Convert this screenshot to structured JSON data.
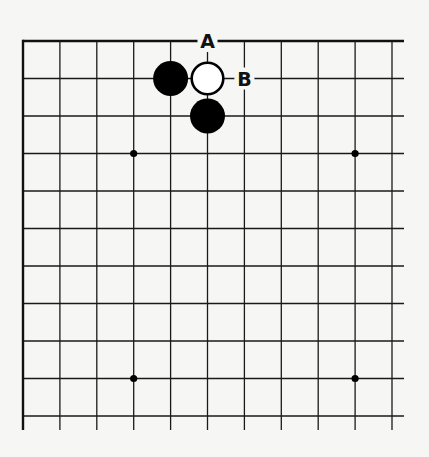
{
  "diagram": {
    "type": "go-board-corner",
    "grid": {
      "columns": 11,
      "rows": 11,
      "origin_x": 23,
      "origin_y": 41,
      "spacing_x": 36.9,
      "spacing_y": 37.5,
      "extend_right": 12,
      "extend_bottom": 14,
      "line_color": "#1a1a1a",
      "edge_line_color": "#111111",
      "edges": [
        "top",
        "left"
      ]
    },
    "star_points": [
      {
        "col": 3,
        "row": 3
      },
      {
        "col": 9,
        "row": 3
      },
      {
        "col": 3,
        "row": 9
      },
      {
        "col": 9,
        "row": 9
      }
    ],
    "stones": [
      {
        "color": "black",
        "col": 4,
        "row": 1
      },
      {
        "color": "white",
        "col": 5,
        "row": 1
      },
      {
        "color": "black",
        "col": 5,
        "row": 2
      }
    ],
    "labels": [
      {
        "text": "A",
        "col": 5,
        "row": 0
      },
      {
        "text": "B",
        "col": 6,
        "row": 1
      }
    ],
    "colors": {
      "background": "#f6f6f4",
      "black_stone": "#000000",
      "white_stone_fill": "#ffffff",
      "white_stone_stroke": "#000000"
    }
  }
}
